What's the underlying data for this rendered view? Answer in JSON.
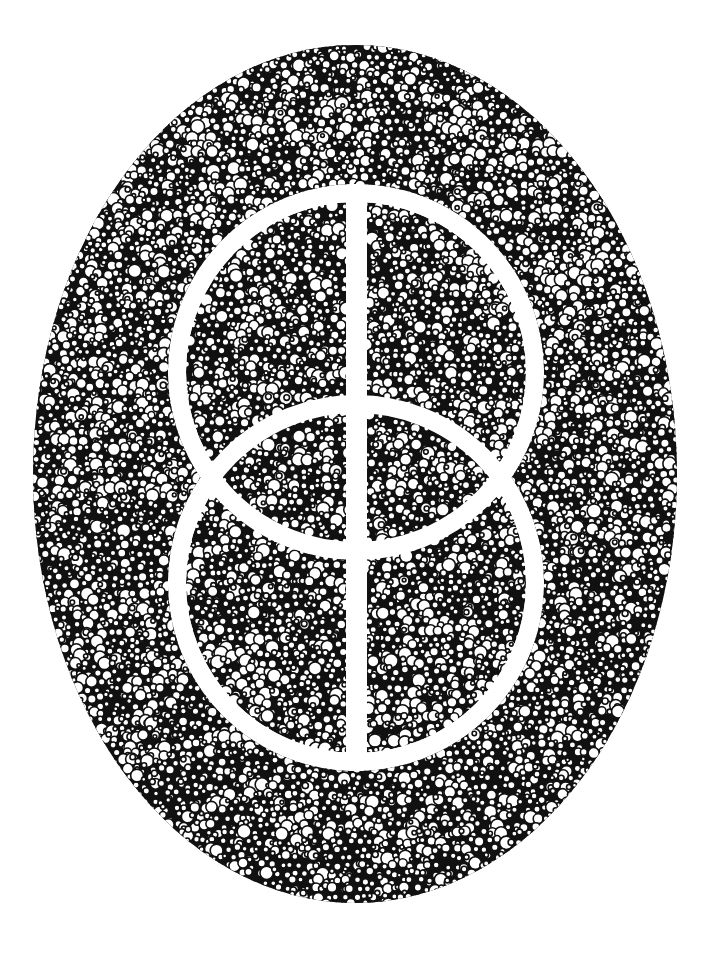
{
  "canvas": {
    "width": 719,
    "height": 958,
    "background": "#ffffff"
  },
  "artwork": {
    "style": "pen-and-ink bubble stipple",
    "ink_color": "#111111",
    "paper_color": "#ffffff",
    "outer_ellipse": {
      "cx": 355,
      "cy": 474,
      "rx": 322,
      "ry": 429
    },
    "upper_circle": {
      "cx": 356,
      "cy": 372,
      "r_outer": 188,
      "r_inner": 170
    },
    "lower_circle": {
      "cx": 356,
      "cy": 583,
      "r_outer": 188,
      "r_inner": 170
    },
    "vertical_bar": {
      "x": 346,
      "width": 21
    },
    "bubble": {
      "min_r": 2.2,
      "max_r": 7.5,
      "stroke_width": 1.6,
      "seed": 7
    }
  }
}
